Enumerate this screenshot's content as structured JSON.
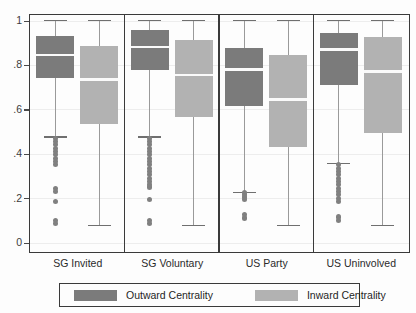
{
  "chart_data": {
    "type": "box",
    "title": "",
    "xlabel": "",
    "ylabel": "",
    "ylim": [
      0,
      1
    ],
    "grid": true,
    "legend_position": "bottom",
    "yticks": [
      0,
      0.2,
      0.4,
      0.6,
      0.8,
      1
    ],
    "ytick_labels": [
      "0",
      ".2",
      ".4",
      ".6",
      ".8",
      "1"
    ],
    "categories": [
      "SG Invited",
      "SG Voluntary",
      "US Party",
      "US Uninvolved"
    ],
    "legend": [
      {
        "label": "Outward Centrality",
        "color": "#7b7b7b",
        "key": "outward"
      },
      {
        "label": "Inward Centrality",
        "color": "#b2b2b2",
        "key": "inward"
      }
    ],
    "series": [
      {
        "name": "Outward Centrality",
        "color": "#7b7b7b",
        "boxes": [
          {
            "category": "SG Invited",
            "whisker_high": 1.0,
            "q3": 0.93,
            "median": 0.845,
            "q1": 0.74,
            "whisker_low": 0.475,
            "outliers": [
              0.47,
              0.455,
              0.44,
              0.425,
              0.41,
              0.395,
              0.38,
              0.365,
              0.35,
              0.245,
              0.23,
              0.185,
              0.1,
              0.085
            ]
          },
          {
            "category": "SG Voluntary",
            "whisker_high": 1.0,
            "q3": 0.955,
            "median": 0.88,
            "q1": 0.775,
            "whisker_low": 0.475,
            "outliers": [
              0.47,
              0.455,
              0.44,
              0.425,
              0.41,
              0.395,
              0.38,
              0.365,
              0.35,
              0.335,
              0.32,
              0.305,
              0.29,
              0.275,
              0.26,
              0.25,
              0.195,
              0.1,
              0.085
            ]
          },
          {
            "category": "US Party",
            "whisker_high": 1.0,
            "q3": 0.875,
            "median": 0.78,
            "q1": 0.615,
            "whisker_low": 0.225,
            "outliers": [
              0.225,
              0.215,
              0.205,
              0.195,
              0.125,
              0.11
            ]
          },
          {
            "category": "US Uninvolved",
            "whisker_high": 1.0,
            "q3": 0.945,
            "median": 0.87,
            "q1": 0.71,
            "whisker_low": 0.355,
            "outliers": [
              0.35,
              0.335,
              0.32,
              0.305,
              0.29,
              0.275,
              0.26,
              0.245,
              0.23,
              0.215,
              0.2,
              0.185,
              0.115,
              0.1
            ]
          }
        ]
      },
      {
        "name": "Inward Centrality",
        "color": "#b2b2b2",
        "boxes": [
          {
            "category": "SG Invited",
            "whisker_high": 1.0,
            "q3": 0.885,
            "median": 0.735,
            "q1": 0.535,
            "whisker_low": 0.075,
            "outliers": []
          },
          {
            "category": "SG Voluntary",
            "whisker_high": 1.0,
            "q3": 0.91,
            "median": 0.755,
            "q1": 0.565,
            "whisker_low": 0.075,
            "outliers": []
          },
          {
            "category": "US Party",
            "whisker_high": 1.0,
            "q3": 0.845,
            "median": 0.645,
            "q1": 0.43,
            "whisker_low": 0.075,
            "outliers": []
          },
          {
            "category": "US Uninvolved",
            "whisker_high": 1.0,
            "q3": 0.925,
            "median": 0.77,
            "q1": 0.495,
            "whisker_low": 0.075,
            "outliers": []
          }
        ]
      }
    ]
  }
}
